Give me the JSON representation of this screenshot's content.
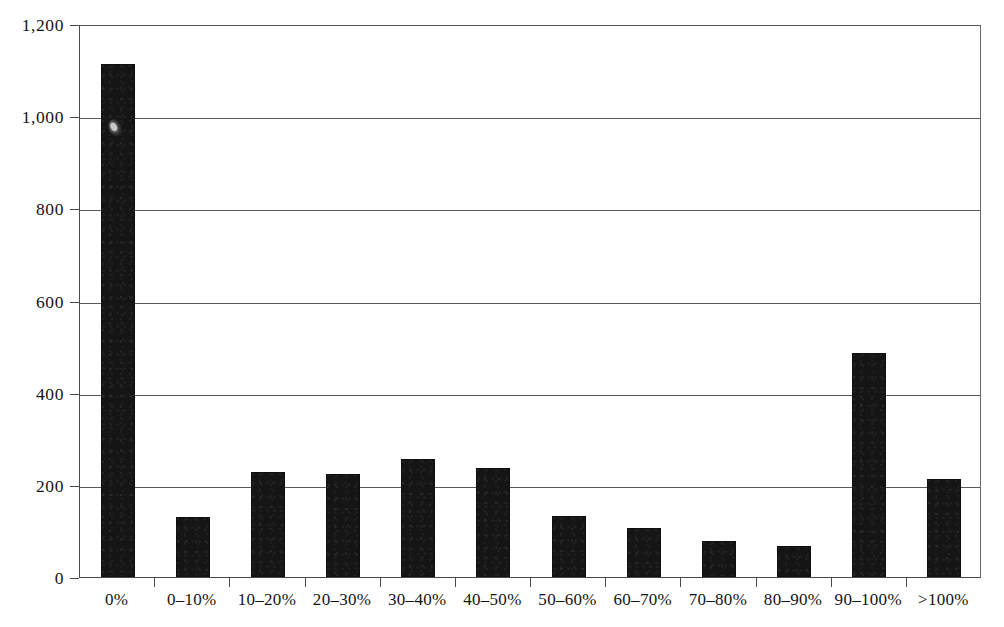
{
  "chart_data": {
    "type": "bar",
    "title": "",
    "subtitle": "",
    "xlabel": "",
    "ylabel": "",
    "categories": [
      "0%",
      "0–10%",
      "10–20%",
      "20–30%",
      "30–40%",
      "40–50%",
      "50–60%",
      "60–70%",
      "70–80%",
      "80–90%",
      "90–100%",
      ">100%"
    ],
    "values": [
      1113,
      130,
      228,
      223,
      256,
      237,
      132,
      107,
      79,
      68,
      487,
      213
    ],
    "ylim": [
      0,
      1200
    ],
    "ytick_values": [
      0,
      200,
      400,
      600,
      800,
      1000,
      1200
    ],
    "ytick_labels": [
      "0",
      "200",
      "400",
      "600",
      "800",
      "1,000",
      "1,200"
    ],
    "grid": "horizontal",
    "legend": "none",
    "bar_color": "#151515",
    "axis_color": "#4a4a4a",
    "annotations": []
  }
}
